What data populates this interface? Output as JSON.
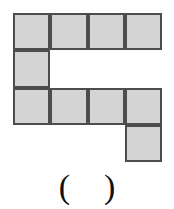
{
  "figure": {
    "type": "polyomino-grid-puzzle",
    "grid": {
      "columns": 4,
      "rows": 4,
      "cell_size_px": 37,
      "origin_x_px": 13,
      "origin_y_px": 13,
      "fill_color": "#d4d4d4",
      "border_color": "#4d4d4d",
      "background_color": "#ffffff",
      "filled_cells": [
        [
          true,
          true,
          true,
          true
        ],
        [
          true,
          false,
          false,
          false
        ],
        [
          true,
          true,
          true,
          true
        ],
        [
          false,
          false,
          false,
          true
        ]
      ],
      "filled_count": 10,
      "shape_description": "S-shaped / zigzag polyomino made of 10 squares"
    }
  },
  "answer": {
    "open_paren": "(",
    "blank": " ",
    "close_paren": ")",
    "value": ""
  }
}
